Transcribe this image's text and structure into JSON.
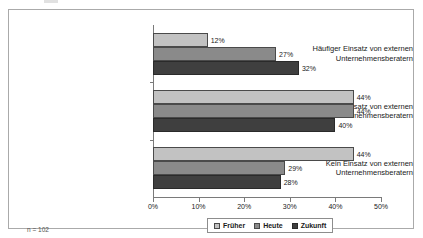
{
  "footnote": "n = 102",
  "chart_data": {
    "type": "bar",
    "orientation": "horizontal",
    "title": "",
    "subtitle": "",
    "xlabel": "",
    "ylabel": "",
    "xlim": [
      0,
      50
    ],
    "grid": false,
    "legend_position": "bottom",
    "xtick_labels": [
      "0%",
      "10%",
      "20%",
      "30%",
      "40%",
      "50%"
    ],
    "xtick_values": [
      0,
      10,
      20,
      30,
      40,
      50
    ],
    "categories": [
      "Häufiger Einsatz von externen Unternehmensberatern",
      "Seltener Einsatz von externen Unternehmensberatern",
      "Kein Einsatz von externen Unternehmensberatern"
    ],
    "category_lines": [
      [
        "Häufiger Einsatz von externen",
        "Unternehmensberatern"
      ],
      [
        "Seltener Einsatz von externen",
        "Unternehmensberatern"
      ],
      [
        "Kein Einsatz von externen",
        "Unternehmensberatern"
      ]
    ],
    "series": [
      {
        "name": "Früher",
        "color": "#c2c2c2",
        "values": [
          12,
          44,
          44
        ],
        "labels": [
          "12%",
          "44%",
          "44%"
        ]
      },
      {
        "name": "Heute",
        "color": "#8a8a8a",
        "values": [
          27,
          44,
          29
        ],
        "labels": [
          "27%",
          "44%",
          "29%"
        ]
      },
      {
        "name": "Zukunft",
        "color": "#3f3f3f",
        "values": [
          32,
          40,
          28
        ],
        "labels": [
          "32%",
          "40%",
          "28%"
        ]
      }
    ]
  }
}
